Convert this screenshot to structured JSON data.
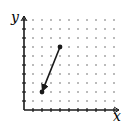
{
  "diagram": {
    "type": "vector-on-dot-grid",
    "axes": {
      "x_label": "x",
      "y_label": "y",
      "origin_px": [
        24,
        110
      ],
      "spacing_px": 9,
      "x_max_units": 10,
      "y_max_units": 10
    },
    "vector": {
      "start": [
        4,
        7
      ],
      "end": [
        2,
        2
      ],
      "arrow_at": "end"
    },
    "colors": {
      "axis": "#1a1a1a",
      "dots": "#555555",
      "vector": "#1a1a1a",
      "background": "#ffffff"
    }
  }
}
